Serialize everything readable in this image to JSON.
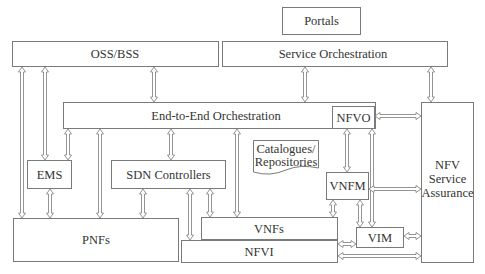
{
  "diagram": {
    "title": "",
    "nodes": {
      "portals": {
        "label": "Portals"
      },
      "oss_bss": {
        "label": "OSS/BSS"
      },
      "service_orchestration": {
        "label": "Service Orchestration"
      },
      "e2e_orchestration": {
        "label": "End-to-End Orchestration"
      },
      "nfvo": {
        "label": "NFVO"
      },
      "nfv_service_assurance": {
        "label_line1": "NFV",
        "label_line2": "Service",
        "label_line3": "Assurance"
      },
      "ems": {
        "label": "EMS"
      },
      "sdn_controllers": {
        "label": "SDN Controllers"
      },
      "catalogues": {
        "label_line1": "Catalogues/",
        "label_line2": "Repositories"
      },
      "vnfm": {
        "label": "VNFM"
      },
      "vnfs": {
        "label": "VNFs"
      },
      "vim": {
        "label": "VIM"
      },
      "pnfs": {
        "label": "PNFs"
      },
      "nfvi": {
        "label": "NFVI"
      }
    },
    "edges": [
      {
        "from": "OSS/BSS",
        "to": "PNFs",
        "type": "bidirectional"
      },
      {
        "from": "OSS/BSS",
        "to": "EMS",
        "type": "bidirectional"
      },
      {
        "from": "OSS/BSS",
        "to": "End-to-End Orchestration",
        "type": "bidirectional"
      },
      {
        "from": "Service Orchestration",
        "to": "End-to-End Orchestration",
        "type": "bidirectional"
      },
      {
        "from": "Service Orchestration",
        "to": "NFV Service Assurance",
        "type": "bidirectional"
      },
      {
        "from": "End-to-End Orchestration",
        "to": "EMS",
        "type": "bidirectional"
      },
      {
        "from": "End-to-End Orchestration",
        "to": "PNFs",
        "type": "bidirectional"
      },
      {
        "from": "End-to-End Orchestration",
        "to": "SDN Controllers",
        "type": "bidirectional"
      },
      {
        "from": "End-to-End Orchestration",
        "to": "VNFs",
        "type": "bidirectional"
      },
      {
        "from": "NFVO",
        "to": "NFV Service Assurance",
        "type": "bidirectional"
      },
      {
        "from": "NFVO",
        "to": "VNFM",
        "type": "bidirectional"
      },
      {
        "from": "NFVO",
        "to": "VIM",
        "type": "bidirectional"
      },
      {
        "from": "EMS",
        "to": "PNFs",
        "type": "bidirectional"
      },
      {
        "from": "SDN Controllers",
        "to": "PNFs",
        "type": "bidirectional"
      },
      {
        "from": "SDN Controllers",
        "to": "NFVI",
        "type": "bidirectional"
      },
      {
        "from": "SDN Controllers",
        "to": "VNFs",
        "type": "bidirectional"
      },
      {
        "from": "VNFM",
        "to": "VNFs",
        "type": "bidirectional"
      },
      {
        "from": "VNFM",
        "to": "VIM",
        "type": "bidirectional"
      },
      {
        "from": "VNFM",
        "to": "NFV Service Assurance",
        "type": "bidirectional"
      },
      {
        "from": "VIM",
        "to": "NFVI",
        "type": "bidirectional"
      },
      {
        "from": "VIM",
        "to": "NFV Service Assurance",
        "type": "bidirectional"
      },
      {
        "from": "NFVI",
        "to": "NFV Service Assurance",
        "type": "bidirectional"
      }
    ]
  }
}
